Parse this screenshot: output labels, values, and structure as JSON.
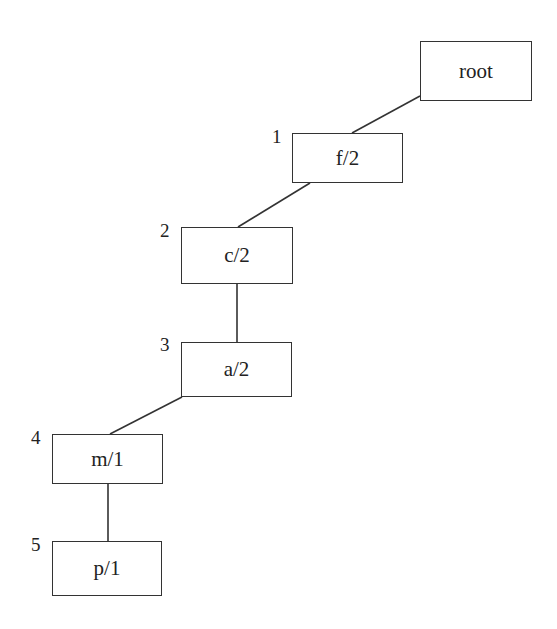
{
  "nodes": [
    {
      "id": "root",
      "label": "root",
      "index": "",
      "x": 420,
      "y": 41,
      "w": 112,
      "h": 60
    },
    {
      "id": "f",
      "label": "f/2",
      "index": "1",
      "x": 292,
      "y": 133,
      "w": 111,
      "h": 50
    },
    {
      "id": "c",
      "label": "c/2",
      "index": "2",
      "x": 181,
      "y": 227,
      "w": 112,
      "h": 57
    },
    {
      "id": "a",
      "label": "a/2",
      "index": "3",
      "x": 181,
      "y": 342,
      "w": 111,
      "h": 55
    },
    {
      "id": "m",
      "label": "m/1",
      "index": "4",
      "x": 52,
      "y": 434,
      "w": 111,
      "h": 50
    },
    {
      "id": "p",
      "label": "p/1",
      "index": "5",
      "x": 52,
      "y": 541,
      "w": 110,
      "h": 55
    }
  ],
  "edges": [
    {
      "from": "root",
      "to": "f",
      "x1": 420,
      "y1": 96,
      "x2": 352,
      "y2": 133
    },
    {
      "from": "f",
      "to": "c",
      "x1": 310,
      "y1": 183,
      "x2": 238,
      "y2": 227
    },
    {
      "from": "c",
      "to": "a",
      "x1": 237,
      "y1": 284,
      "x2": 237,
      "y2": 342
    },
    {
      "from": "a",
      "to": "m",
      "x1": 182,
      "y1": 397,
      "x2": 110,
      "y2": 434
    },
    {
      "from": "m",
      "to": "p",
      "x1": 108,
      "y1": 484,
      "x2": 108,
      "y2": 541
    }
  ],
  "labels": {
    "root": "root",
    "f": "f/2",
    "c": "c/2",
    "a": "a/2",
    "m": "m/1",
    "p": "p/1",
    "i1": "1",
    "i2": "2",
    "i3": "3",
    "i4": "4",
    "i5": "5"
  }
}
